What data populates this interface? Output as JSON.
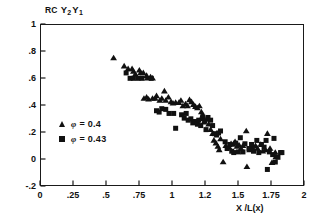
{
  "chart_data": {
    "type": "scatter",
    "title_parts": {
      "prefix": "RC",
      "var1": "Y",
      "sub1": "2",
      "var2": "Y",
      "sub2": "1"
    },
    "xlabel": "X /L(x)",
    "ylabel": "",
    "xlim": [
      0,
      2
    ],
    "ylim": [
      -0.2,
      1
    ],
    "grid": false,
    "legend_position": "inside-left",
    "xticks": [
      "0",
      ".25",
      ".5",
      ".75",
      "1",
      "1.2",
      "1.5",
      "1.75",
      "2"
    ],
    "xtick_values": [
      0,
      0.25,
      0.5,
      0.75,
      1,
      1.25,
      1.5,
      1.75,
      2
    ],
    "yticks": [
      "1",
      ".8",
      ".6",
      ".4",
      ".2",
      "0",
      "-.2"
    ],
    "ytick_values": [
      1,
      0.8,
      0.6,
      0.4,
      0.2,
      0,
      -0.2
    ],
    "series": [
      {
        "name": "φ = 0.4",
        "label_symbol": "φ",
        "label_value": "0.4",
        "marker": "triangle",
        "color": "#111111",
        "points": [
          [
            0.55,
            0.755
          ],
          [
            0.63,
            0.695
          ],
          [
            0.66,
            0.675
          ],
          [
            0.69,
            0.675
          ],
          [
            0.7,
            0.655
          ],
          [
            0.715,
            0.635
          ],
          [
            0.745,
            0.665
          ],
          [
            0.755,
            0.645
          ],
          [
            0.775,
            0.645
          ],
          [
            0.8,
            0.625
          ],
          [
            0.805,
            0.605
          ],
          [
            0.83,
            0.615
          ],
          [
            0.845,
            0.605
          ],
          [
            0.78,
            0.455
          ],
          [
            0.8,
            0.465
          ],
          [
            0.815,
            0.45
          ],
          [
            0.845,
            0.455
          ],
          [
            0.865,
            0.455
          ],
          [
            0.875,
            0.475
          ],
          [
            0.9,
            0.44
          ],
          [
            0.915,
            0.455
          ],
          [
            0.935,
            0.51
          ],
          [
            0.945,
            0.44
          ],
          [
            0.965,
            0.465
          ],
          [
            0.985,
            0.43
          ],
          [
            1.0,
            0.42
          ],
          [
            1.02,
            0.425
          ],
          [
            1.045,
            0.425
          ],
          [
            1.06,
            0.44
          ],
          [
            1.075,
            0.4
          ],
          [
            1.095,
            0.415
          ],
          [
            1.11,
            0.4
          ],
          [
            1.125,
            0.445
          ],
          [
            1.14,
            0.43
          ],
          [
            1.155,
            0.41
          ],
          [
            1.17,
            0.395
          ],
          [
            1.185,
            0.385
          ],
          [
            1.2,
            0.4
          ],
          [
            1.215,
            0.355
          ],
          [
            1.225,
            0.33
          ],
          [
            1.22,
            0.305
          ],
          [
            1.235,
            0.28
          ],
          [
            1.255,
            0.3
          ],
          [
            1.27,
            0.265
          ],
          [
            1.285,
            0.225
          ],
          [
            1.3,
            0.195
          ],
          [
            1.31,
            0.145
          ],
          [
            1.325,
            0.125
          ],
          [
            1.34,
            0.1
          ],
          [
            1.35,
            0.075
          ],
          [
            1.36,
            0.155
          ],
          [
            1.38,
            -0.015
          ],
          [
            1.4,
            0.105
          ],
          [
            1.425,
            0.095
          ],
          [
            1.44,
            0.12
          ],
          [
            1.455,
            0.115
          ],
          [
            1.47,
            0.135
          ],
          [
            1.485,
            0.1
          ],
          [
            1.5,
            0.11
          ],
          [
            1.515,
            0.085
          ],
          [
            1.53,
            0.105
          ],
          [
            1.555,
            0.215
          ],
          [
            1.56,
            -0.05
          ],
          [
            1.58,
            0.075
          ],
          [
            1.6,
            0.095
          ],
          [
            1.625,
            0.105
          ],
          [
            1.64,
            0.085
          ],
          [
            1.665,
            0.115
          ],
          [
            1.68,
            0.065
          ],
          [
            1.7,
            0.075
          ],
          [
            1.715,
            0.195
          ],
          [
            1.735,
            0.085
          ],
          [
            1.75,
            -0.02
          ],
          [
            1.775,
            0.055
          ],
          [
            1.78,
            0.025
          ]
        ]
      },
      {
        "name": "φ = 0.43",
        "label_symbol": "φ",
        "label_value": "0.43",
        "marker": "square",
        "color": "#111111",
        "points": [
          [
            0.645,
            0.645
          ],
          [
            0.675,
            0.605
          ],
          [
            0.7,
            0.605
          ],
          [
            0.735,
            0.605
          ],
          [
            0.765,
            0.605
          ],
          [
            0.835,
            0.605
          ],
          [
            0.875,
            0.365
          ],
          [
            0.895,
            0.355
          ],
          [
            0.915,
            0.38
          ],
          [
            0.945,
            0.375
          ],
          [
            0.97,
            0.345
          ],
          [
            1.005,
            0.345
          ],
          [
            1.02,
            0.235
          ],
          [
            1.065,
            0.335
          ],
          [
            1.085,
            0.31
          ],
          [
            1.1,
            0.345
          ],
          [
            1.115,
            0.295
          ],
          [
            1.135,
            0.305
          ],
          [
            1.15,
            0.275
          ],
          [
            1.165,
            0.285
          ],
          [
            1.185,
            0.265
          ],
          [
            1.195,
            0.295
          ],
          [
            1.21,
            0.255
          ],
          [
            1.225,
            0.32
          ],
          [
            1.24,
            0.29
          ],
          [
            1.25,
            0.225
          ],
          [
            1.265,
            0.315
          ],
          [
            1.285,
            0.295
          ],
          [
            1.3,
            0.255
          ],
          [
            1.315,
            0.195
          ],
          [
            1.33,
            0.185
          ],
          [
            1.345,
            0.2
          ],
          [
            1.36,
            0.215
          ],
          [
            1.395,
            0.135
          ],
          [
            1.41,
            0.085
          ],
          [
            1.43,
            0.115
          ],
          [
            1.445,
            0.065
          ],
          [
            1.46,
            0.055
          ],
          [
            1.475,
            0.125
          ],
          [
            1.495,
            0.06
          ],
          [
            1.51,
            0.165
          ],
          [
            1.53,
            0.06
          ],
          [
            1.545,
            0.12
          ],
          [
            1.575,
            0.085
          ],
          [
            1.595,
            0.115
          ],
          [
            1.61,
            0.065
          ],
          [
            1.635,
            0.145
          ],
          [
            1.65,
            0.055
          ],
          [
            1.67,
            0.115
          ],
          [
            1.69,
            0.095
          ],
          [
            1.705,
            0.145
          ],
          [
            1.715,
            -0.07
          ],
          [
            1.73,
            0.06
          ],
          [
            1.755,
            0.04
          ],
          [
            1.765,
            0.16
          ],
          [
            1.775,
            -0.015
          ],
          [
            1.795,
            0.02
          ],
          [
            1.815,
            0.055
          ],
          [
            1.825,
            0.055
          ]
        ]
      }
    ]
  }
}
